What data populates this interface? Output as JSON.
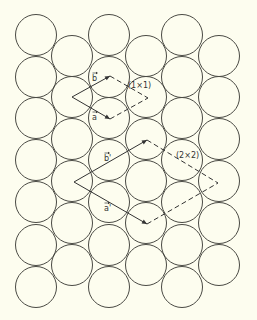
{
  "diagram": {
    "colors": {
      "background": "#fdfdef",
      "line": "#333333",
      "atom_outline": "#4a4a44"
    },
    "atom_radius": 20.5,
    "atom_columns": [
      {
        "x": 36,
        "ys": [
          35,
          77,
          118,
          160,
          202,
          245,
          287
        ]
      },
      {
        "x": 72,
        "ys": [
          56,
          97,
          139,
          181,
          223,
          265
        ]
      },
      {
        "x": 109,
        "ys": [
          35,
          77,
          118,
          160,
          202,
          245,
          287
        ]
      },
      {
        "x": 146,
        "ys": [
          56,
          97,
          139,
          181,
          223,
          265
        ]
      },
      {
        "x": 182,
        "ys": [
          35,
          77,
          118,
          160,
          202,
          245,
          287
        ]
      },
      {
        "x": 219,
        "ys": [
          56,
          97,
          139,
          181,
          223,
          265
        ]
      }
    ],
    "cells": [
      {
        "name": "(1×1)",
        "label": "(1×1)",
        "vertices": {
          "left": [
            72,
            97
          ],
          "top": [
            110,
            76
          ],
          "bottom": [
            110,
            119
          ],
          "right": [
            148,
            98
          ]
        },
        "vector_labels": {
          "b": "b",
          "a": "a"
        },
        "label_pos": [
          128,
          88
        ],
        "b_pos": [
          92,
          81
        ],
        "a_pos": [
          92,
          120
        ]
      },
      {
        "name": "(2×2)",
        "label": "(2×2)",
        "vertices": {
          "left": [
            74,
            182
          ],
          "top": [
            147,
            140
          ],
          "bottom": [
            147,
            224
          ],
          "right": [
            218,
            183
          ]
        },
        "vector_labels": {
          "b": "b'",
          "a": "a'"
        },
        "label_pos": [
          176,
          158
        ],
        "b_pos": [
          104,
          161
        ],
        "a_pos": [
          104,
          211
        ]
      }
    ]
  }
}
